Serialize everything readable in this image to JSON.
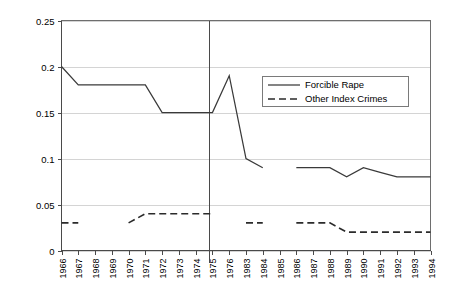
{
  "chart_data": {
    "type": "line",
    "title": "",
    "xlabel": "",
    "ylabel": "",
    "ylim": [
      0,
      0.25
    ],
    "ytick_labels": [
      "0.25",
      "0.2",
      "0.15",
      "0.1",
      "0.05",
      "0"
    ],
    "ytick_values": [
      0.25,
      0.2,
      0.15,
      0.1,
      0.05,
      0
    ],
    "grid": true,
    "legend_position": "upper-right",
    "categories": [
      "1966",
      "1967",
      "1968",
      "1969",
      "1970",
      "1971",
      "1972",
      "1973",
      "1974",
      "1975",
      "1976",
      "1983",
      "1984",
      "1985",
      "1986",
      "1987",
      "1988",
      "1989",
      "1990",
      "1991",
      "1992",
      "1993",
      "1994"
    ],
    "annotations": [
      {
        "name": "period-divider",
        "type": "vertical-line",
        "between": [
          "1976",
          "1983"
        ]
      }
    ],
    "series": [
      {
        "name": "Forcible Rape",
        "style": "solid",
        "values": [
          0.2,
          0.18,
          0.18,
          0.18,
          0.18,
          0.18,
          0.15,
          0.15,
          0.15,
          0.15,
          0.19,
          0.1,
          0.09,
          null,
          0.09,
          0.09,
          0.09,
          0.08,
          0.09,
          0.085,
          0.08,
          0.08,
          0.08
        ]
      },
      {
        "name": "Other Index Crimes",
        "style": "dashed",
        "values": [
          0.03,
          0.03,
          null,
          null,
          0.03,
          0.04,
          0.04,
          0.04,
          0.04,
          0.04,
          null,
          0.03,
          0.03,
          null,
          0.03,
          0.03,
          0.03,
          0.02,
          0.02,
          0.02,
          0.02,
          0.02,
          0.02
        ]
      }
    ]
  },
  "legend": {
    "items": [
      {
        "label": "Forcible Rape",
        "style": "solid"
      },
      {
        "label": "Other Index Crimes",
        "style": "dashed"
      }
    ]
  },
  "colors": {
    "series_solid": "#3a3a3a",
    "series_dashed": "#2b2b2b",
    "gridline": "#d4d4d4",
    "axis": "#4a4a4a",
    "background": "#ffffff"
  }
}
